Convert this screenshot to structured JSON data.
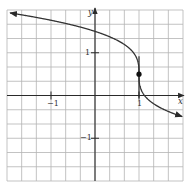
{
  "chart_data": {
    "type": "line",
    "title": "",
    "xlabel": "x",
    "ylabel": "y",
    "xlim": [
      -2,
      2
    ],
    "ylim": [
      -2,
      2
    ],
    "grid": true,
    "grid_step": 0.3333,
    "x_ticks": [
      {
        "value": -1,
        "label": "-1"
      },
      {
        "value": 1,
        "label": "1"
      }
    ],
    "y_ticks": [
      {
        "value": 1,
        "label": "1"
      },
      {
        "value": -1,
        "label": "-1"
      }
    ],
    "series": [
      {
        "name": "curve",
        "description": "y = 0.5 - cbrt(x - 1), decreasing, vertical tangent at x = 1, arrows at both ends",
        "x": [
          -2.0,
          -1.5,
          -1.0,
          -0.5,
          0.0,
          0.5,
          0.8,
          0.95,
          1.0,
          1.05,
          1.2,
          1.5,
          2.0
        ],
        "y": [
          1.94,
          1.86,
          1.76,
          1.64,
          1.5,
          1.29,
          1.08,
          0.87,
          0.5,
          0.13,
          -0.08,
          -0.29,
          -0.5
        ]
      }
    ],
    "annotations": [
      {
        "type": "point",
        "x": 1,
        "y": 0.5,
        "label": "filled dot"
      },
      {
        "type": "vertical_tangent_line",
        "x": 1,
        "y_from": -0.05,
        "y_to": 0.92
      }
    ]
  },
  "labels": {
    "x_axis": "x",
    "y_axis": "y",
    "x_tick_neg1": "−1",
    "x_tick_1": "1",
    "y_tick_1": "1",
    "y_tick_neg1": "−1"
  },
  "colors": {
    "grid": "#b4b4b4",
    "axis": "#2a2a2a",
    "curve": "#333333",
    "background": "#ffffff"
  }
}
